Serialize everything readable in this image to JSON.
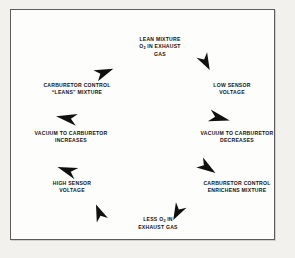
{
  "diagram": {
    "direction": "clockwise",
    "frame_color": "#5c5c5c",
    "page_color": "#f2f1ee",
    "panel_color": "#fdfdfc",
    "arrow_color": "#101010",
    "text_color": "#111111",
    "nodes": [
      {
        "id": "lean-mixture",
        "position": "top",
        "lines": [
          "LEAN MIXTURE",
          "O2 IN EXHAUST",
          "GAS"
        ],
        "line1": "LEAN MIXTURE",
        "line2_pre": "O",
        "line2_sub": "2",
        "line2_post": " IN EXHAUST",
        "line3": "GAS"
      },
      {
        "id": "low-sensor-voltage",
        "position": "top-right",
        "lines": [
          "LOW SENSOR",
          "VOLTAGE"
        ],
        "line1": "LOW SENSOR",
        "line2": "VOLTAGE"
      },
      {
        "id": "vacuum-decreases",
        "position": "right",
        "lines": [
          "VACUUM TO CARBURETOR",
          "DECREASES"
        ],
        "line1": "VACUUM TO CARBURETOR",
        "line2": "DECREASES"
      },
      {
        "id": "control-enrichens",
        "position": "bottom-right",
        "lines": [
          "CARBURETOR CONTROL",
          "ENRICHENS MIXTURE"
        ],
        "line1": "CARBURETOR CONTROL",
        "line2": "ENRICHENS MIXTURE"
      },
      {
        "id": "less-o2-exhaust",
        "position": "bottom",
        "lines": [
          "LESS O2 IN",
          "EXHAUST GAS"
        ],
        "line1_pre": "LESS O",
        "line1_sub": "2",
        "line1_post": " IN",
        "line2": "EXHAUST GAS"
      },
      {
        "id": "high-sensor-voltage",
        "position": "bottom-left",
        "lines": [
          "HIGH SENSOR",
          "VOLTAGE"
        ],
        "line1": "HIGH SENSOR",
        "line2": "VOLTAGE"
      },
      {
        "id": "vacuum-increases",
        "position": "left",
        "lines": [
          "VACUUM TO CARBURETOR",
          "INCREASES"
        ],
        "line1": "VACUUM TO CARBURETOR",
        "line2": "INCREASES"
      },
      {
        "id": "control-leans",
        "position": "top-left",
        "lines": [
          "CARBURETOR CONTROL",
          "\"LEANS\" MIXTURE"
        ],
        "line1": "CARBURETOR CONTROL",
        "line2": "“LEANS” MIXTURE"
      }
    ],
    "arrows": [
      {
        "id": "arrow-to-lean-mixture",
        "from": "control-leans",
        "to": "lean-mixture",
        "heading_deg": -160
      },
      {
        "id": "arrow-to-low-sensor-voltage",
        "from": "lean-mixture",
        "to": "low-sensor-voltage",
        "heading_deg": 115
      },
      {
        "id": "arrow-to-vacuum-decreases",
        "from": "low-sensor-voltage",
        "to": "vacuum-decreases",
        "heading_deg": 150
      },
      {
        "id": "arrow-to-control-enrichens",
        "from": "vacuum-decreases",
        "to": "control-enrichens",
        "heading_deg": 120
      },
      {
        "id": "arrow-to-less-o2",
        "from": "control-enrichens",
        "to": "less-o2-exhaust",
        "heading_deg": 205
      },
      {
        "id": "arrow-to-high-sensor",
        "from": "less-o2-exhaust",
        "to": "high-sensor-voltage",
        "heading_deg": 290
      },
      {
        "id": "arrow-to-vacuum-increases",
        "from": "high-sensor-voltage",
        "to": "vacuum-increases",
        "heading_deg": 325
      },
      {
        "id": "arrow-to-control-leans",
        "from": "vacuum-increases",
        "to": "control-leans",
        "heading_deg": 295
      }
    ]
  }
}
